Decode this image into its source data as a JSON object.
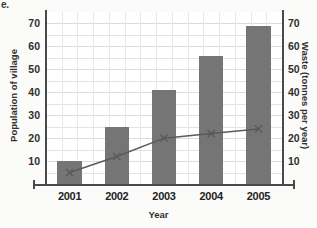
{
  "question_label": "e.",
  "chart_data": {
    "type": "bar",
    "title": "",
    "xlabel": "Year",
    "ylabel": "Population of village",
    "y2label": "Waste (tonnes per year)",
    "categories": [
      "2001",
      "2002",
      "2003",
      "2004",
      "2005"
    ],
    "ylim": [
      0,
      75
    ],
    "y2lim": [
      0,
      75
    ],
    "yticks": [
      10,
      20,
      30,
      40,
      50,
      60,
      70
    ],
    "y2ticks": [
      10,
      20,
      30,
      40,
      50,
      60,
      70
    ],
    "grid": true,
    "legend": "none",
    "series": [
      {
        "name": "Population of village",
        "type": "bar",
        "axis": "left",
        "color": "#757575",
        "values": [
          10,
          25,
          41,
          56,
          69
        ]
      },
      {
        "name": "Waste (tonnes per year)",
        "type": "line",
        "axis": "right",
        "color": "#5a5a5a",
        "marker": "x",
        "values": [
          5,
          12,
          20,
          22,
          24
        ]
      }
    ]
  }
}
